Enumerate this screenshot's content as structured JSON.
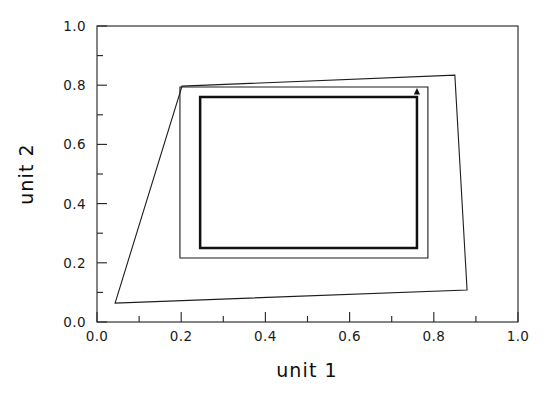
{
  "chart_data": {
    "type": "line",
    "title": "",
    "xlabel": "unit 1",
    "ylabel": "unit 2",
    "xlim": [
      0.0,
      1.0
    ],
    "ylim": [
      0.0,
      1.0
    ],
    "grid": false,
    "legend": "none",
    "xticks": [
      0.0,
      0.2,
      0.4,
      0.6,
      0.8,
      1.0
    ],
    "xtick_labels": [
      "0.0",
      "0.2",
      "0.4",
      "0.6",
      "0.8",
      "1.0"
    ],
    "yticks": [
      0.0,
      0.2,
      0.4,
      0.6,
      0.8,
      1.0
    ],
    "ytick_labels": [
      "0.0",
      "0.2",
      "0.4",
      "0.6",
      "0.8",
      "1.0"
    ],
    "minor_ticks_per_interval": 1,
    "series": [
      {
        "name": "outer-quadrilateral",
        "style": "thin",
        "closed": true,
        "points": [
          [
            0.043,
            0.064
          ],
          [
            0.202,
            0.797
          ],
          [
            0.85,
            0.834
          ],
          [
            0.879,
            0.108
          ]
        ]
      },
      {
        "name": "middle-rectangle",
        "style": "thin",
        "closed": true,
        "points": [
          [
            0.197,
            0.216
          ],
          [
            0.197,
            0.794
          ],
          [
            0.786,
            0.794
          ],
          [
            0.786,
            0.216
          ]
        ]
      },
      {
        "name": "inner-rectangle",
        "style": "thick",
        "closed": true,
        "points": [
          [
            0.245,
            0.25
          ],
          [
            0.245,
            0.76
          ],
          [
            0.76,
            0.76
          ],
          [
            0.76,
            0.25
          ]
        ]
      }
    ],
    "annotations": [
      {
        "name": "direction-arrow",
        "type": "arrowhead",
        "at": [
          0.76,
          0.76
        ],
        "direction": "up"
      }
    ]
  },
  "axes": {
    "x_title": "unit 1",
    "y_title": "unit 2",
    "x_tick_labels": [
      "0.0",
      "0.2",
      "0.4",
      "0.6",
      "0.8",
      "1.0"
    ],
    "y_tick_labels": [
      "0.0",
      "0.2",
      "0.4",
      "0.6",
      "0.8",
      "1.0"
    ]
  },
  "colors": {
    "background": "#ffffff",
    "frame": "#2b2b2b",
    "curve": "#1d1d1d",
    "curve_emphasis": "#101010",
    "text": "#1a1a1a"
  }
}
